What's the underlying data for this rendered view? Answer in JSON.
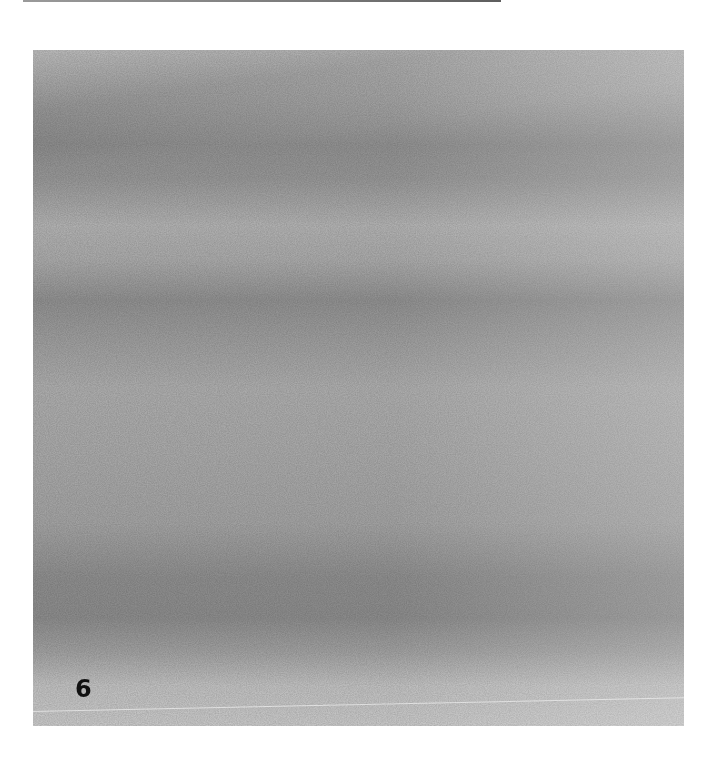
{
  "figure": {
    "panel_label": "6",
    "colors": {
      "background": "#ffffff",
      "light_tone": "#c6c6c6",
      "mid_tone": "#a5a5a5",
      "dark_tone": "#8a8a8a",
      "label": "#111111"
    }
  }
}
